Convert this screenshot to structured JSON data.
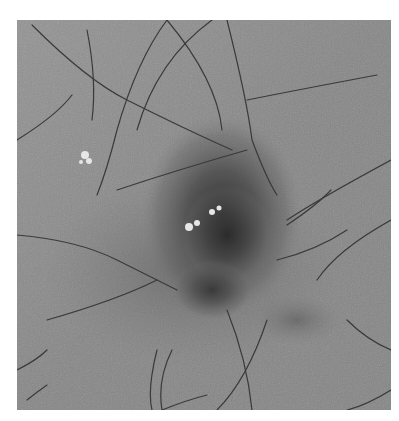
{
  "image": {
    "description": "Grayscale dermoscopy image of a skin lesion with a dark irregular central pigmented area, white structures near the center, a small whitish spot on the left, and many fine dark hairs crossing the field",
    "colors": {
      "background": "#ffffff",
      "skin": "#8a8a8a",
      "lesion_dark": "#2e2e2e",
      "hair": "#3a3a3a",
      "white_spots": "#e8e8e8"
    }
  }
}
